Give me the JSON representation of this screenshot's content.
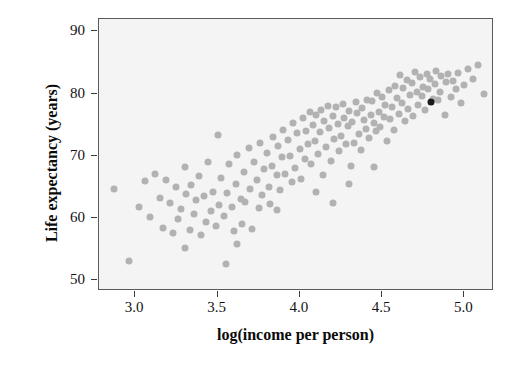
{
  "chart_data": {
    "type": "scatter",
    "title": "",
    "xlabel": "log(income per person)",
    "ylabel": "Life expectancy (years)",
    "xlim": [
      2.78,
      5.18
    ],
    "ylim": [
      48.2,
      92.0
    ],
    "xticks": [
      "3.0",
      "3.5",
      "4.0",
      "4.5",
      "5.0"
    ],
    "xtick_values": [
      3.0,
      3.5,
      4.0,
      4.5,
      5.0
    ],
    "yticks": [
      "50",
      "60",
      "70",
      "80",
      "90"
    ],
    "ytick_values": [
      50,
      60,
      70,
      80,
      90
    ],
    "grid": false,
    "legend": null,
    "colors": {
      "point": "#b2b2b2",
      "highlight": "#1a1a1a",
      "panel_background": "#f4f4f4",
      "panel_border": "#5a5a5a",
      "text": "#0b0b0b"
    },
    "highlight_point": {
      "x": 4.8,
      "y": 78.7,
      "color": "#1a1a1a"
    },
    "points": [
      [
        2.87,
        64.6
      ],
      [
        2.96,
        53.1
      ],
      [
        3.02,
        61.7
      ],
      [
        3.06,
        65.9
      ],
      [
        3.09,
        60.1
      ],
      [
        3.12,
        67.0
      ],
      [
        3.15,
        63.2
      ],
      [
        3.17,
        58.4
      ],
      [
        3.19,
        66.1
      ],
      [
        3.21,
        62.3
      ],
      [
        3.23,
        57.6
      ],
      [
        3.25,
        64.9
      ],
      [
        3.26,
        59.8
      ],
      [
        3.28,
        61.4
      ],
      [
        3.3,
        68.2
      ],
      [
        3.31,
        63.8
      ],
      [
        3.33,
        58.0
      ],
      [
        3.34,
        65.2
      ],
      [
        3.36,
        60.6
      ],
      [
        3.37,
        62.8
      ],
      [
        3.39,
        66.7
      ],
      [
        3.4,
        57.2
      ],
      [
        3.42,
        63.5
      ],
      [
        3.43,
        59.3
      ],
      [
        3.44,
        68.9
      ],
      [
        3.46,
        61.1
      ],
      [
        3.47,
        64.2
      ],
      [
        3.49,
        58.7
      ],
      [
        3.5,
        73.4
      ],
      [
        3.51,
        62.0
      ],
      [
        3.52,
        66.4
      ],
      [
        3.54,
        60.3
      ],
      [
        3.55,
        52.5
      ],
      [
        3.56,
        64.0
      ],
      [
        3.57,
        68.6
      ],
      [
        3.59,
        61.8
      ],
      [
        3.6,
        57.9
      ],
      [
        3.61,
        65.5
      ],
      [
        3.62,
        70.1
      ],
      [
        3.64,
        63.0
      ],
      [
        3.65,
        59.0
      ],
      [
        3.66,
        67.3
      ],
      [
        3.67,
        62.5
      ],
      [
        3.69,
        71.2
      ],
      [
        3.7,
        64.7
      ],
      [
        3.71,
        58.2
      ],
      [
        3.72,
        69.0
      ],
      [
        3.74,
        66.0
      ],
      [
        3.75,
        61.5
      ],
      [
        3.76,
        72.0
      ],
      [
        3.77,
        63.6
      ],
      [
        3.78,
        67.8
      ],
      [
        3.8,
        70.5
      ],
      [
        3.81,
        65.0
      ],
      [
        3.82,
        62.2
      ],
      [
        3.83,
        68.4
      ],
      [
        3.84,
        73.0
      ],
      [
        3.86,
        66.9
      ],
      [
        3.87,
        71.6
      ],
      [
        3.88,
        64.4
      ],
      [
        3.89,
        69.7
      ],
      [
        3.9,
        74.2
      ],
      [
        3.91,
        67.1
      ],
      [
        3.93,
        72.5
      ],
      [
        3.94,
        70.0
      ],
      [
        3.95,
        65.7
      ],
      [
        3.96,
        75.3
      ],
      [
        3.97,
        68.0
      ],
      [
        3.98,
        73.6
      ],
      [
        4.0,
        71.0
      ],
      [
        4.01,
        66.3
      ],
      [
        4.02,
        76.1
      ],
      [
        4.03,
        69.4
      ],
      [
        4.04,
        74.0
      ],
      [
        4.05,
        71.8
      ],
      [
        4.06,
        77.0
      ],
      [
        4.07,
        68.7
      ],
      [
        4.08,
        75.0
      ],
      [
        4.09,
        72.3
      ],
      [
        4.1,
        76.6
      ],
      [
        4.11,
        70.3
      ],
      [
        4.12,
        73.8
      ],
      [
        4.13,
        77.4
      ],
      [
        4.14,
        66.8
      ],
      [
        4.15,
        75.6
      ],
      [
        4.16,
        71.4
      ],
      [
        4.17,
        78.0
      ],
      [
        4.18,
        74.5
      ],
      [
        4.19,
        69.1
      ],
      [
        4.2,
        76.3
      ],
      [
        4.21,
        72.7
      ],
      [
        4.22,
        77.8
      ],
      [
        4.23,
        75.1
      ],
      [
        4.24,
        70.7
      ],
      [
        4.25,
        73.2
      ],
      [
        4.26,
        78.3
      ],
      [
        4.27,
        76.0
      ],
      [
        4.28,
        71.9
      ],
      [
        4.29,
        74.8
      ],
      [
        4.3,
        77.2
      ],
      [
        4.31,
        68.3
      ],
      [
        4.32,
        75.4
      ],
      [
        4.33,
        72.1
      ],
      [
        4.34,
        78.6
      ],
      [
        4.35,
        76.8
      ],
      [
        4.36,
        73.5
      ],
      [
        4.37,
        70.9
      ],
      [
        4.38,
        77.6
      ],
      [
        4.39,
        75.8
      ],
      [
        4.4,
        74.3
      ],
      [
        4.41,
        79.0
      ],
      [
        4.42,
        72.9
      ],
      [
        4.43,
        76.5
      ],
      [
        4.44,
        78.8
      ],
      [
        4.45,
        75.2
      ],
      [
        4.46,
        73.9
      ],
      [
        4.47,
        80.1
      ],
      [
        4.48,
        77.1
      ],
      [
        4.49,
        74.6
      ],
      [
        4.5,
        79.4
      ],
      [
        4.51,
        76.2
      ],
      [
        4.52,
        78.1
      ],
      [
        4.53,
        72.4
      ],
      [
        4.54,
        80.6
      ],
      [
        4.55,
        75.9
      ],
      [
        4.56,
        77.9
      ],
      [
        4.57,
        74.1
      ],
      [
        4.58,
        81.2
      ],
      [
        4.59,
        79.2
      ],
      [
        4.6,
        76.7
      ],
      [
        4.61,
        83.0
      ],
      [
        4.62,
        78.4
      ],
      [
        4.63,
        80.9
      ],
      [
        4.64,
        75.5
      ],
      [
        4.65,
        82.1
      ],
      [
        4.66,
        77.5
      ],
      [
        4.67,
        79.8
      ],
      [
        4.68,
        81.7
      ],
      [
        4.69,
        76.4
      ],
      [
        4.7,
        83.4
      ],
      [
        4.71,
        80.3
      ],
      [
        4.72,
        78.2
      ],
      [
        4.73,
        82.6
      ],
      [
        4.74,
        79.6
      ],
      [
        4.75,
        81.0
      ],
      [
        4.76,
        77.3
      ],
      [
        4.77,
        83.2
      ],
      [
        4.78,
        80.7
      ],
      [
        4.79,
        82.3
      ],
      [
        4.81,
        79.1
      ],
      [
        4.82,
        81.5
      ],
      [
        4.83,
        83.6
      ],
      [
        4.84,
        78.9
      ],
      [
        4.85,
        80.2
      ],
      [
        4.86,
        82.8
      ],
      [
        4.88,
        76.5
      ],
      [
        4.89,
        81.9
      ],
      [
        4.9,
        83.1
      ],
      [
        4.92,
        79.5
      ],
      [
        4.93,
        82.0
      ],
      [
        4.95,
        80.8
      ],
      [
        4.96,
        83.3
      ],
      [
        4.98,
        78.5
      ],
      [
        5.0,
        81.3
      ],
      [
        5.02,
        84.0
      ],
      [
        5.05,
        82.4
      ],
      [
        5.08,
        84.6
      ],
      [
        5.12,
        80.0
      ],
      [
        4.2,
        62.4
      ],
      [
        4.1,
        64.2
      ],
      [
        3.86,
        61.2
      ],
      [
        4.45,
        68.2
      ],
      [
        4.3,
        65.5
      ],
      [
        3.62,
        55.8
      ],
      [
        3.3,
        55.2
      ]
    ]
  }
}
